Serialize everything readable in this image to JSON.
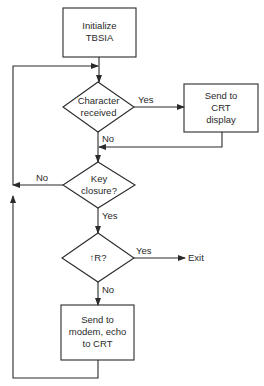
{
  "diagram": {
    "type": "flowchart",
    "colors": {
      "stroke": "#2a2a2a",
      "background": "#ffffff"
    },
    "nodes": {
      "init": {
        "shape": "process",
        "text": "Initialize\nTBSIA"
      },
      "char_received": {
        "shape": "decision",
        "text": "Character\nreceived"
      },
      "send_crt": {
        "shape": "process",
        "text": "Send to\nCRT\ndisplay"
      },
      "key_closure": {
        "shape": "decision",
        "text": "Key\nclosure?"
      },
      "ctrl_r": {
        "shape": "decision",
        "text": "↑R?"
      },
      "send_modem": {
        "shape": "process",
        "text": "Send to\nmodem, echo\nto CRT"
      },
      "exit": {
        "shape": "terminal-text",
        "text": "Exit"
      }
    },
    "edges": {
      "init_to_char": {
        "from": "init",
        "to": "char_received",
        "label": ""
      },
      "char_yes": {
        "from": "char_received",
        "to": "send_crt",
        "label": "Yes"
      },
      "char_no": {
        "from": "char_received",
        "to": "key_closure",
        "label": "No"
      },
      "crt_to_key": {
        "from": "send_crt",
        "to": "key_closure",
        "label": ""
      },
      "key_no": {
        "from": "key_closure",
        "to": "char_received",
        "label": "No"
      },
      "key_yes": {
        "from": "key_closure",
        "to": "ctrl_r",
        "label": "Yes"
      },
      "ctrlr_yes": {
        "from": "ctrl_r",
        "to": "exit",
        "label": "Yes"
      },
      "ctrlr_no": {
        "from": "ctrl_r",
        "to": "send_modem",
        "label": "No"
      },
      "modem_loop": {
        "from": "send_modem",
        "to": "char_received",
        "label": ""
      }
    }
  }
}
